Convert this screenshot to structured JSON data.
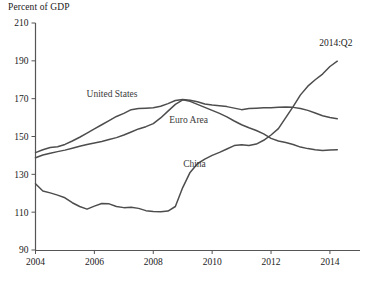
{
  "chart_data": {
    "type": "line",
    "title": "Percent of GDP",
    "xlabel": "",
    "ylabel": "Percent of GDP",
    "xlim": [
      2004,
      2014.75
    ],
    "ylim": [
      90,
      210
    ],
    "grid": false,
    "legend": "inline-labels",
    "yticks": [
      90,
      110,
      130,
      150,
      170,
      190,
      210
    ],
    "xticks": [
      2004,
      2006,
      2008,
      2010,
      2012,
      2014
    ],
    "ytick_labels": [
      "90",
      "110",
      "130",
      "150",
      "170",
      "190",
      "210"
    ],
    "xtick_labels": [
      "2004",
      "2006",
      "2008",
      "2010",
      "2012",
      "2014"
    ],
    "annotations": [
      {
        "text": "2014:Q2",
        "x": 2014.2,
        "y": 198
      }
    ],
    "series": [
      {
        "name": "United States",
        "label_x": 2006.6,
        "label_y": 171,
        "x": [
          2004.0,
          2004.25,
          2004.5,
          2004.75,
          2005.0,
          2005.25,
          2005.5,
          2005.75,
          2006.0,
          2006.25,
          2006.5,
          2006.75,
          2007.0,
          2007.25,
          2007.5,
          2007.75,
          2008.0,
          2008.25,
          2008.5,
          2008.75,
          2009.0,
          2009.25,
          2009.5,
          2009.75,
          2010.0,
          2010.25,
          2010.5,
          2010.75,
          2011.0,
          2011.25,
          2011.5,
          2011.75,
          2012.0,
          2012.25,
          2012.5,
          2012.75,
          2013.0,
          2013.25,
          2013.5,
          2013.75,
          2014.0,
          2014.25
        ],
        "values": [
          141.5,
          143.0,
          144.2,
          144.6,
          145.8,
          147.6,
          149.6,
          151.8,
          154.0,
          156.2,
          158.4,
          160.6,
          162.2,
          164.2,
          164.8,
          165.0,
          165.2,
          166.0,
          167.4,
          169.0,
          169.6,
          169.2,
          168.4,
          167.2,
          166.6,
          166.2,
          165.8,
          165.0,
          164.2,
          164.8,
          165.0,
          165.2,
          165.2,
          165.4,
          165.6,
          165.4,
          164.8,
          163.8,
          162.4,
          161.0,
          160.0,
          159.4
        ]
      },
      {
        "name": "Euro Area",
        "label_x": 2009.2,
        "label_y": 157,
        "x": [
          2004.0,
          2004.25,
          2004.5,
          2004.75,
          2005.0,
          2005.25,
          2005.5,
          2005.75,
          2006.0,
          2006.25,
          2006.5,
          2006.75,
          2007.0,
          2007.25,
          2007.5,
          2007.75,
          2008.0,
          2008.25,
          2008.5,
          2008.75,
          2009.0,
          2009.25,
          2009.5,
          2009.75,
          2010.0,
          2010.25,
          2010.5,
          2010.75,
          2011.0,
          2011.25,
          2011.5,
          2011.75,
          2012.0,
          2012.25,
          2012.5,
          2012.75,
          2013.0,
          2013.25,
          2013.5,
          2013.75,
          2014.0,
          2014.25
        ],
        "values": [
          138.8,
          140.2,
          141.2,
          142.0,
          142.8,
          143.8,
          144.8,
          145.8,
          146.6,
          147.4,
          148.4,
          149.4,
          150.8,
          152.4,
          154.0,
          155.2,
          156.8,
          159.8,
          163.4,
          167.0,
          169.4,
          168.6,
          167.0,
          165.4,
          163.8,
          162.2,
          160.4,
          158.2,
          156.2,
          154.6,
          153.2,
          151.4,
          149.0,
          147.6,
          146.8,
          145.8,
          144.4,
          143.6,
          143.0,
          142.6,
          142.8,
          143.0
        ]
      },
      {
        "name": "China",
        "label_x": 2009.4,
        "label_y": 134,
        "x": [
          2004.0,
          2004.25,
          2004.5,
          2004.75,
          2005.0,
          2005.25,
          2005.5,
          2005.75,
          2006.0,
          2006.25,
          2006.5,
          2006.75,
          2007.0,
          2007.25,
          2007.5,
          2007.75,
          2008.0,
          2008.25,
          2008.5,
          2008.75,
          2009.0,
          2009.25,
          2009.5,
          2009.75,
          2010.0,
          2010.25,
          2010.5,
          2010.75,
          2011.0,
          2011.25,
          2011.5,
          2011.75,
          2012.0,
          2012.25,
          2012.5,
          2012.75,
          2013.0,
          2013.25,
          2013.5,
          2013.75,
          2014.0,
          2014.25
        ],
        "values": [
          125.0,
          121.2,
          120.2,
          119.0,
          117.6,
          115.0,
          113.0,
          111.6,
          113.2,
          114.6,
          114.4,
          113.0,
          112.4,
          112.6,
          112.0,
          110.8,
          110.4,
          110.2,
          110.6,
          113.0,
          123.0,
          131.0,
          135.6,
          138.0,
          140.0,
          141.6,
          143.4,
          145.2,
          145.6,
          145.2,
          146.0,
          148.0,
          150.8,
          154.2,
          160.0,
          165.8,
          172.0,
          176.6,
          180.0,
          183.0,
          187.0,
          189.8
        ]
      }
    ]
  }
}
